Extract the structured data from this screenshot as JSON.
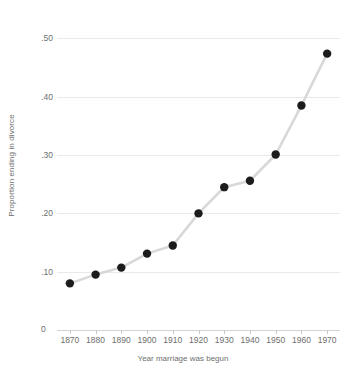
{
  "chart_data": {
    "type": "line",
    "title": "",
    "subtitle": "",
    "xlabel": "Year marriage was begun",
    "ylabel": "Proportion ending in divorce",
    "x": [
      1870,
      1880,
      1890,
      1900,
      1910,
      1920,
      1930,
      1940,
      1950,
      1960,
      1970
    ],
    "values": [
      0.08,
      0.095,
      0.107,
      0.131,
      0.145,
      0.2,
      0.245,
      0.256,
      0.301,
      0.385,
      0.474
    ],
    "xtick_labels": [
      "1870",
      "1880",
      "1890",
      "1900",
      "1910",
      "1920",
      "1930",
      "1940",
      "1950",
      "1960",
      "1970"
    ],
    "ytick_values": [
      0.1,
      0.2,
      0.3,
      0.4,
      0.5
    ],
    "ytick_labels": [
      ".10",
      ".20",
      ".30",
      ".40",
      ".50"
    ],
    "origin_label": "0",
    "xlim": [
      1865,
      1975
    ],
    "ylim": [
      0,
      0.53
    ],
    "grid": "horizontal",
    "legend": "none",
    "series": [
      {
        "name": "Proportion ending in divorce",
        "values": [
          0.08,
          0.095,
          0.107,
          0.131,
          0.145,
          0.2,
          0.245,
          0.256,
          0.301,
          0.385,
          0.474
        ]
      }
    ],
    "colors": {
      "marker": "#1c1c1c",
      "line": "#d8d8d8",
      "grid": "#e9e9e9",
      "axis_text": "#6e6e6e",
      "background": "#ffffff"
    },
    "marker_size": 4.2,
    "line_width": 2.6
  }
}
